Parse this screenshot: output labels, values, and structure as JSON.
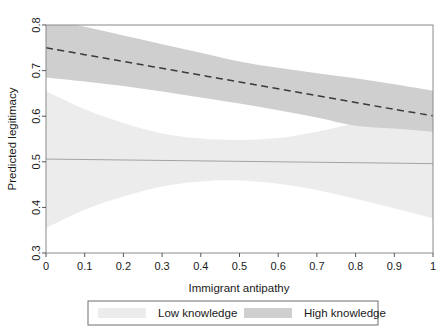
{
  "chart_data": {
    "type": "area",
    "title": "",
    "xlabel": "Immigrant antipathy",
    "ylabel": "Predicted legitimacy",
    "xlim": [
      0,
      1
    ],
    "ylim": [
      0.3,
      0.8
    ],
    "grid": false,
    "legend_position": "bottom",
    "xticks": [
      "0",
      "0.1",
      "0.2",
      "0.3",
      "0.4",
      "0.5",
      "0.6",
      "0.7",
      "0.8",
      "0.9",
      "1"
    ],
    "xtick_values": [
      0,
      0.1,
      0.2,
      0.3,
      0.4,
      0.5,
      0.6,
      0.7,
      0.8,
      0.9,
      1
    ],
    "yticks": [
      "0.3",
      "0.4",
      "0.5",
      "0.6",
      "0.7",
      "0.8"
    ],
    "ytick_values": [
      0.3,
      0.4,
      0.5,
      0.6,
      0.7,
      0.8
    ],
    "x": [
      0,
      0.1,
      0.2,
      0.3,
      0.4,
      0.5,
      0.6,
      0.7,
      0.8,
      0.9,
      1
    ],
    "series": [
      {
        "name": "Low knowledge",
        "type": "ci-band-with-line",
        "color": "#ececec",
        "line_color": "#9a9a9a",
        "line_style": "solid",
        "values": [
          0.506,
          0.505,
          0.504,
          0.503,
          0.502,
          0.501,
          0.5,
          0.499,
          0.498,
          0.497,
          0.496
        ],
        "upper": [
          0.655,
          0.615,
          0.585,
          0.562,
          0.551,
          0.548,
          0.552,
          0.566,
          0.585,
          0.604,
          0.621
        ],
        "lower": [
          0.355,
          0.395,
          0.424,
          0.446,
          0.457,
          0.459,
          0.452,
          0.438,
          0.419,
          0.398,
          0.376
        ]
      },
      {
        "name": "High knowledge",
        "type": "ci-band-with-line",
        "color": "#cfcfcf",
        "line_color": "#3a3a3a",
        "line_style": "dashed",
        "values": [
          0.75,
          0.735,
          0.72,
          0.705,
          0.69,
          0.675,
          0.66,
          0.645,
          0.63,
          0.615,
          0.601
        ],
        "upper": [
          0.815,
          0.796,
          0.777,
          0.758,
          0.739,
          0.72,
          0.706,
          0.694,
          0.683,
          0.67,
          0.656
        ],
        "lower": [
          0.685,
          0.676,
          0.666,
          0.654,
          0.641,
          0.628,
          0.613,
          0.597,
          0.579,
          0.573,
          0.566
        ]
      }
    ],
    "legend": [
      {
        "label": "Low knowledge",
        "color": "#ececec"
      },
      {
        "label": "High knowledge",
        "color": "#cfcfcf"
      }
    ]
  },
  "axes": {
    "frame_color": "#808080",
    "tick_color": "#555555",
    "text_color": "#1a1a1a"
  }
}
